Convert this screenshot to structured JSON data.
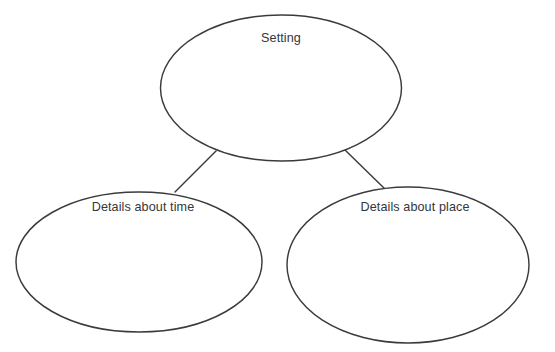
{
  "diagram": {
    "type": "concept-map",
    "title_node": "Setting",
    "background_color": "#ffffff",
    "stroke_color": "#3b3b3e",
    "text_color": "#35353a",
    "nodes": [
      {
        "id": "setting",
        "label": "Setting",
        "shape": "ellipse",
        "cx": 281,
        "cy": 88,
        "rx": 120.5,
        "ry": 73,
        "label_x": 281,
        "label_y": 32
      },
      {
        "id": "details-about-time",
        "label": "Details about time",
        "shape": "ellipse",
        "cx": 139,
        "cy": 262,
        "rx": 123,
        "ry": 70,
        "label_x": 143,
        "label_y": 201
      },
      {
        "id": "details-about-place",
        "label": "Details about place",
        "shape": "ellipse",
        "cx": 408,
        "cy": 265,
        "rx": 121,
        "ry": 78,
        "label_x": 415,
        "label_y": 201
      }
    ],
    "connectors": [
      {
        "id": "setting-to-time",
        "from": "setting",
        "to": "details-about-time",
        "x1": 216,
        "y1": 151,
        "x2": 175,
        "y2": 192
      },
      {
        "id": "setting-to-place",
        "from": "setting",
        "to": "details-about-place",
        "x1": 345,
        "y1": 150,
        "x2": 386,
        "y2": 190
      }
    ]
  }
}
